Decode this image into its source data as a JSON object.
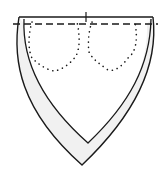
{
  "diagram": {
    "colors": {
      "line": "#1a1a1a",
      "shade": "#ececec",
      "background": "#ffffff"
    },
    "elements": [
      {
        "name": "outer-outline",
        "type": "shield-outline"
      },
      {
        "name": "inner-outline",
        "type": "v-neck-inner-line"
      },
      {
        "name": "top-edge",
        "type": "solid-line"
      },
      {
        "name": "fold-line",
        "type": "dashed-line"
      },
      {
        "name": "center-mark",
        "type": "tick"
      },
      {
        "name": "left-pocket",
        "type": "dotted-pocket"
      },
      {
        "name": "right-pocket",
        "type": "dotted-pocket"
      }
    ]
  }
}
